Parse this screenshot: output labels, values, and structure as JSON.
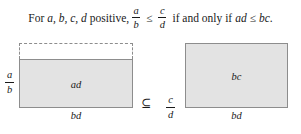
{
  "statement": {
    "lead": "For",
    "variables": "a, b, c, d",
    "positive": "positive,",
    "lhs_numerator": "a",
    "lhs_denominator": "b",
    "relation_1": "≤",
    "rhs_numerator": "c",
    "rhs_denominator": "d",
    "connector": "if and only if",
    "product_left": "ad",
    "relation_2": "≤",
    "product_right": "bc",
    "period": "."
  },
  "figure": {
    "left_group": {
      "height_fraction": {
        "numerator": "a",
        "denominator": "b"
      },
      "rectangle_label": "ad",
      "base_label": "bd",
      "dashed_extension": true
    },
    "relation_symbol": "⊆",
    "right_group": {
      "height_fraction": {
        "numerator": "c",
        "denominator": "d"
      },
      "rectangle_label": "bc",
      "base_label": "bd"
    }
  },
  "colors": {
    "rectangle_fill": "#e3e3e3",
    "rectangle_border": "#8d8d8d",
    "dashed_border": "#8d8d8d",
    "text": "#1a1a1a",
    "background": "#ffffff"
  }
}
